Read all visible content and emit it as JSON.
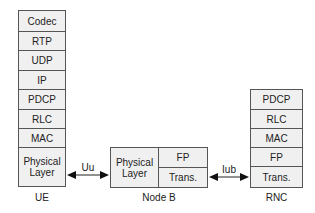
{
  "ue": {
    "label": "UE",
    "layers": [
      "Codec",
      "RTP",
      "UDP",
      "IP",
      "PDCP",
      "RLC",
      "MAC",
      "Physical Layer"
    ]
  },
  "node_b": {
    "label": "Node B",
    "left_layer": "Physical Layer",
    "right_layers": [
      "FP",
      "Trans."
    ]
  },
  "rnc": {
    "label": "RNC",
    "layers": [
      "PDCP",
      "RLC",
      "MAC",
      "FP",
      "Trans."
    ]
  },
  "interfaces": {
    "uu": "Uu",
    "iub": "Iub"
  }
}
